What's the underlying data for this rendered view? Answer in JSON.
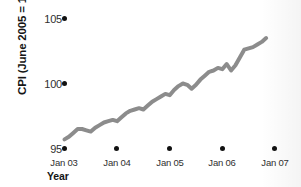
{
  "chart_data": {
    "type": "line",
    "title": "",
    "xlabel": "Year",
    "ylabel": "CPI (June 2005 = 100)",
    "ylim": [
      95,
      105
    ],
    "yticks": [
      95,
      100,
      105
    ],
    "ytick_labels": [
      "95",
      "100",
      "105"
    ],
    "xticks": [
      "Jan 03",
      "Jan 04",
      "Jan 05",
      "Jan 06",
      "Jan 07"
    ],
    "grid": false,
    "legend": null,
    "tick_marker_style": "filled-circle",
    "line_color": "#8c8c8c",
    "line_width_px": 4,
    "x": [
      "Jan 03",
      "Feb 03",
      "Mar 03",
      "Apr 03",
      "May 03",
      "Jun 03",
      "Jul 03",
      "Aug 03",
      "Sep 03",
      "Oct 03",
      "Nov 03",
      "Dec 03",
      "Jan 04",
      "Feb 04",
      "Mar 04",
      "Apr 04",
      "May 04",
      "Jun 04",
      "Jul 04",
      "Aug 04",
      "Sep 04",
      "Oct 04",
      "Nov 04",
      "Dec 04",
      "Jan 05",
      "Feb 05",
      "Mar 05",
      "Apr 05",
      "May 05",
      "Jun 05",
      "Jul 05",
      "Aug 05",
      "Sep 05",
      "Oct 05",
      "Nov 05",
      "Dec 05",
      "Jan 06",
      "Feb 06",
      "Mar 06",
      "Apr 06",
      "May 06",
      "Jun 06",
      "Jul 06",
      "Aug 06",
      "Sep 06",
      "Oct 06",
      "Nov 06"
    ],
    "values": [
      95.7,
      95.9,
      96.2,
      96.5,
      96.5,
      96.4,
      96.3,
      96.6,
      96.8,
      97.0,
      97.1,
      97.2,
      97.1,
      97.4,
      97.7,
      97.9,
      98.0,
      98.1,
      98.0,
      98.3,
      98.6,
      98.8,
      99.0,
      99.2,
      99.1,
      99.5,
      99.8,
      100.0,
      99.9,
      99.6,
      99.9,
      100.3,
      100.6,
      100.9,
      101.0,
      101.2,
      101.1,
      101.5,
      101.0,
      101.4,
      102.0,
      102.6,
      102.7,
      102.8,
      103.0,
      103.2,
      103.5
    ],
    "series_name": "CPI"
  },
  "axis": {
    "ylabel": "CPI (June 2005 = 100)",
    "xlabel": "Year",
    "ytick_105": "105",
    "ytick_100": "100",
    "ytick_95": "95",
    "xtick_0": "Jan 03",
    "xtick_1": "Jan 04",
    "xtick_2": "Jan 05",
    "xtick_3": "Jan 06",
    "xtick_4": "Jan 07"
  },
  "colors": {
    "line": "#8c8c8c",
    "marker": "#111111",
    "text": "#151515",
    "background": "#ffffff"
  }
}
